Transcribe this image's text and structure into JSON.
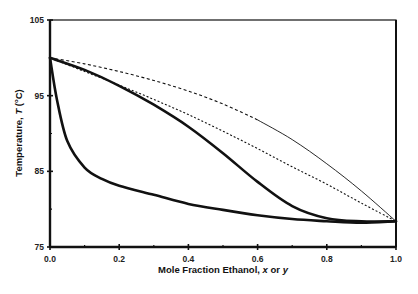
{
  "chart_data": {
    "type": "line",
    "title": "",
    "xlabel": "Mole Fraction Ethanol, x or y",
    "xlabel_parts": [
      "Mole Fraction Ethanol, ",
      "x",
      " or ",
      "y"
    ],
    "ylabel": "Temperature, T (°C)",
    "ylabel_parts": [
      "Temperature, ",
      "T",
      " (",
      "o",
      "C)"
    ],
    "xlim": [
      0.0,
      1.0
    ],
    "ylim": [
      75,
      105
    ],
    "x_ticks": [
      "0.0",
      "0.2",
      "0.4",
      "0.6",
      "0.8",
      "1.0"
    ],
    "x_tick_values": [
      0.0,
      0.2,
      0.4,
      0.6,
      0.8,
      1.0
    ],
    "x_minor_ticks": [
      0.1,
      0.3,
      0.5,
      0.7,
      0.9
    ],
    "y_ticks": [
      "75",
      "85",
      "95",
      "105"
    ],
    "y_tick_values": [
      75,
      85,
      95,
      105
    ],
    "y_minor_ticks": [
      80,
      90,
      100
    ],
    "grid": false,
    "legend": null,
    "series": [
      {
        "name": "Ideal bubble-point (dashed, upper)",
        "style": "dashed-then-thin",
        "x": [
          0.0,
          0.1,
          0.2,
          0.3,
          0.4,
          0.5,
          0.6,
          0.7,
          0.8,
          0.9,
          1.0
        ],
        "y": [
          100.0,
          99.2,
          98.2,
          97.0,
          95.6,
          93.9,
          91.8,
          89.2,
          86.0,
          82.4,
          78.4
        ]
      },
      {
        "name": "Ideal dew-point (dashed, lower)",
        "style": "dashed",
        "x": [
          0.0,
          0.1,
          0.2,
          0.3,
          0.4,
          0.5,
          0.6,
          0.7,
          0.8,
          0.9,
          1.0
        ],
        "y": [
          100.0,
          98.2,
          96.4,
          94.5,
          92.5,
          90.3,
          88.0,
          85.6,
          83.3,
          80.8,
          78.4
        ]
      },
      {
        "name": "Actual dew-point (vapor, y)",
        "style": "bold",
        "x": [
          0.0,
          0.1,
          0.2,
          0.3,
          0.4,
          0.5,
          0.6,
          0.7,
          0.8,
          0.9,
          1.0
        ],
        "y": [
          100.0,
          98.4,
          96.3,
          93.8,
          90.9,
          87.4,
          83.6,
          80.4,
          78.8,
          78.4,
          78.4
        ]
      },
      {
        "name": "Actual bubble-point (liquid, x)",
        "style": "bold",
        "x": [
          0.0,
          0.02,
          0.05,
          0.1,
          0.15,
          0.2,
          0.3,
          0.4,
          0.5,
          0.6,
          0.7,
          0.8,
          0.9,
          1.0
        ],
        "y": [
          100.0,
          94.5,
          89.0,
          85.5,
          84.0,
          83.1,
          81.9,
          80.7,
          79.9,
          79.2,
          78.7,
          78.4,
          78.2,
          78.4
        ]
      }
    ]
  }
}
